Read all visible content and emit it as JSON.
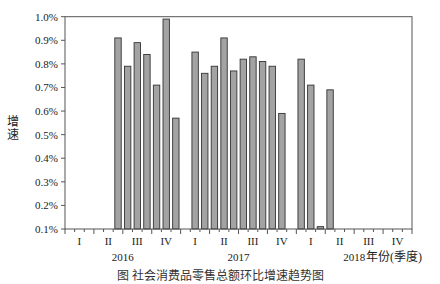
{
  "chart_data": {
    "type": "bar",
    "title": "",
    "caption": "图 社会消费品零售总额环比增速趋势图",
    "ylabel": "增速",
    "xlabel": "年份(季度)",
    "ylim": [
      0.1,
      1.0
    ],
    "y_ticks": [
      "1.0%",
      "0.9%",
      "0.8%",
      "0.7%",
      "0.6%",
      "0.5%",
      "0.4%",
      "0.3%",
      "0.2%",
      "0.1%"
    ],
    "grid": false,
    "x_months_total": 36,
    "quarter_labels": [
      "I",
      "II",
      "III",
      "IV",
      "I",
      "II",
      "III",
      "IV",
      "I",
      "II",
      "III",
      "IV"
    ],
    "year_labels": [
      "2016",
      "2017",
      "2018"
    ],
    "bar_color": "#a3a3a3",
    "bar_edge_color": "#333333",
    "series": [
      {
        "name": "环比增速(%)",
        "points": [
          {
            "month_index": 5,
            "label": "2016-06",
            "value": 0.91
          },
          {
            "month_index": 6,
            "label": "2016-07",
            "value": 0.79
          },
          {
            "month_index": 7,
            "label": "2016-08",
            "value": 0.89
          },
          {
            "month_index": 8,
            "label": "2016-09",
            "value": 0.84
          },
          {
            "month_index": 9,
            "label": "2016-10",
            "value": 0.71
          },
          {
            "month_index": 10,
            "label": "2016-11",
            "value": 0.99
          },
          {
            "month_index": 11,
            "label": "2016-12",
            "value": 0.57
          },
          {
            "month_index": 13,
            "label": "2017-02",
            "value": 0.85
          },
          {
            "month_index": 14,
            "label": "2017-03",
            "value": 0.76
          },
          {
            "month_index": 15,
            "label": "2017-04",
            "value": 0.79
          },
          {
            "month_index": 16,
            "label": "2017-05",
            "value": 0.91
          },
          {
            "month_index": 17,
            "label": "2017-06",
            "value": 0.77
          },
          {
            "month_index": 18,
            "label": "2017-07",
            "value": 0.82
          },
          {
            "month_index": 19,
            "label": "2017-08",
            "value": 0.83
          },
          {
            "month_index": 20,
            "label": "2017-09",
            "value": 0.81
          },
          {
            "month_index": 21,
            "label": "2017-10",
            "value": 0.79
          },
          {
            "month_index": 22,
            "label": "2017-11",
            "value": 0.59
          },
          {
            "month_index": 24,
            "label": "2018-01",
            "value": 0.82
          },
          {
            "month_index": 25,
            "label": "2018-02",
            "value": 0.71
          },
          {
            "month_index": 26,
            "label": "2018-03",
            "value": 0.11
          },
          {
            "month_index": 27,
            "label": "2018-04",
            "value": 0.69
          }
        ]
      }
    ]
  }
}
